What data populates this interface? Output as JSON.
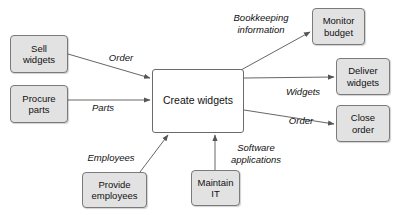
{
  "diagram": {
    "type": "context-flow-diagram",
    "colors": {
      "node_fill": "#e2e2e2",
      "node_border": "#7a7a7a",
      "central_fill": "#ffffff",
      "central_border": "#6b6b6b",
      "edge_stroke": "#555555",
      "text": "#111111",
      "background": "#ffffff"
    },
    "nodes": [
      {
        "id": "sell-widgets",
        "label": "Sell\nwidgets",
        "line1": "Sell",
        "line2": "widgets",
        "x": 10,
        "y": 35,
        "w": 58,
        "h": 38,
        "central": false
      },
      {
        "id": "procure-parts",
        "label": "Procure\nparts",
        "line1": "Procure",
        "line2": "parts",
        "x": 10,
        "y": 85,
        "w": 58,
        "h": 38,
        "central": false
      },
      {
        "id": "create-widgets",
        "label": "Create widgets",
        "line1": "Create widgets",
        "line2": "",
        "x": 152,
        "y": 69,
        "w": 92,
        "h": 64,
        "central": true
      },
      {
        "id": "monitor-budget",
        "label": "Monitor\nbudget",
        "line1": "Monitor",
        "line2": "budget",
        "x": 312,
        "y": 8,
        "w": 53,
        "h": 37,
        "central": false
      },
      {
        "id": "deliver-widgets",
        "label": "Deliver\nwidgets",
        "line1": "Deliver",
        "line2": "widgets",
        "x": 336,
        "y": 58,
        "w": 54,
        "h": 37,
        "central": false
      },
      {
        "id": "close-order",
        "label": "Close\norder",
        "line1": "Close",
        "line2": "order",
        "x": 336,
        "y": 105,
        "w": 54,
        "h": 37,
        "central": false
      },
      {
        "id": "provide-employees",
        "label": "Provide\nemployees",
        "line1": "Provide",
        "line2": "employees",
        "x": 82,
        "y": 172,
        "w": 65,
        "h": 36,
        "central": false
      },
      {
        "id": "maintain-it",
        "label": "Maintain\nIT",
        "line1": "Maintain",
        "line2": "IT",
        "x": 191,
        "y": 170,
        "w": 49,
        "h": 36,
        "central": false
      }
    ],
    "edges": [
      {
        "id": "order-in",
        "label": "Order",
        "from": "sell-widgets",
        "to": "create-widgets",
        "x1": 68,
        "y1": 54,
        "x2": 150,
        "y2": 78,
        "label_x": 104,
        "label_y": 52,
        "label_w": 34
      },
      {
        "id": "parts-in",
        "label": "Parts",
        "from": "procure-parts",
        "to": "create-widgets",
        "x1": 68,
        "y1": 100,
        "x2": 150,
        "y2": 100,
        "label_x": 88,
        "label_y": 102,
        "label_w": 30
      },
      {
        "id": "employees-in",
        "label": "Employees",
        "from": "provide-employees",
        "to": "create-widgets",
        "x1": 140,
        "y1": 172,
        "x2": 168,
        "y2": 135,
        "label_x": 82,
        "label_y": 152,
        "label_w": 58
      },
      {
        "id": "software-in",
        "label": "Software\napplications",
        "from": "maintain-it",
        "to": "create-widgets",
        "x1": 215,
        "y1": 170,
        "x2": 215,
        "y2": 135,
        "label_x": 225,
        "label_y": 142,
        "label_w": 62
      },
      {
        "id": "bookkeeping-out",
        "label": "Bookkeeping\ninformation",
        "from": "create-widgets",
        "to": "monitor-budget",
        "x1": 241,
        "y1": 70,
        "x2": 310,
        "y2": 32,
        "label_x": 226,
        "label_y": 12,
        "label_w": 70
      },
      {
        "id": "widgets-out",
        "label": "Widgets",
        "from": "create-widgets",
        "to": "deliver-widgets",
        "x1": 244,
        "y1": 78,
        "x2": 334,
        "y2": 77,
        "label_x": 282,
        "label_y": 86,
        "label_w": 42
      },
      {
        "id": "order-out",
        "label": "Order",
        "from": "create-widgets",
        "to": "close-order",
        "x1": 244,
        "y1": 110,
        "x2": 334,
        "y2": 124,
        "label_x": 284,
        "label_y": 115,
        "label_w": 34
      }
    ]
  }
}
